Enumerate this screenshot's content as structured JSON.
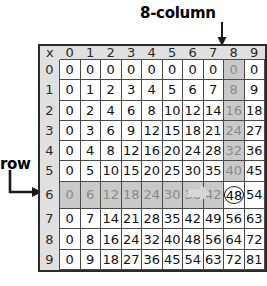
{
  "annotations": {
    "column_label": "8-column",
    "row_label": "-row",
    "column_arrow_icon": "arrow-down-icon",
    "row_arrow_icon": "arrow-elbow-right-icon",
    "inrow_arrow_icon": "arrow-right-icon"
  },
  "table": {
    "corner_symbol": "x",
    "column_headers": [
      "0",
      "1",
      "2",
      "3",
      "4",
      "5",
      "6",
      "7",
      "8",
      "9"
    ],
    "row_headers": [
      "0",
      "1",
      "2",
      "3",
      "4",
      "5",
      "6",
      "7",
      "8",
      "9"
    ],
    "rows": [
      [
        "0",
        "0",
        "0",
        "0",
        "0",
        "0",
        "0",
        "0",
        "0",
        "0"
      ],
      [
        "0",
        "1",
        "2",
        "3",
        "4",
        "5",
        "6",
        "7",
        "8",
        "9"
      ],
      [
        "0",
        "2",
        "4",
        "6",
        "8",
        "10",
        "12",
        "14",
        "16",
        "18"
      ],
      [
        "0",
        "3",
        "6",
        "9",
        "12",
        "15",
        "18",
        "21",
        "24",
        "27"
      ],
      [
        "0",
        "4",
        "8",
        "12",
        "16",
        "20",
        "24",
        "28",
        "32",
        "36"
      ],
      [
        "0",
        "5",
        "10",
        "15",
        "20",
        "25",
        "30",
        "35",
        "40",
        "45"
      ],
      [
        "0",
        "6",
        "12",
        "18",
        "24",
        "30",
        "36",
        "42",
        "48",
        "54"
      ],
      [
        "0",
        "7",
        "14",
        "21",
        "28",
        "35",
        "42",
        "49",
        "56",
        "63"
      ],
      [
        "0",
        "8",
        "16",
        "24",
        "32",
        "40",
        "48",
        "56",
        "64",
        "72"
      ],
      [
        "0",
        "9",
        "18",
        "27",
        "36",
        "45",
        "54",
        "63",
        "72",
        "81"
      ]
    ],
    "highlight": {
      "column_index": 8,
      "row_index": 6,
      "target_value": "48"
    }
  },
  "colors": {
    "page_background": "#ffffff",
    "header_band": "#e0e0e0",
    "shade": "#c9c9c9",
    "cell_border": "#4a4a4a",
    "frame": "#2b2b2b",
    "text": "#111111",
    "shaded_text": "#8a8a8a"
  }
}
